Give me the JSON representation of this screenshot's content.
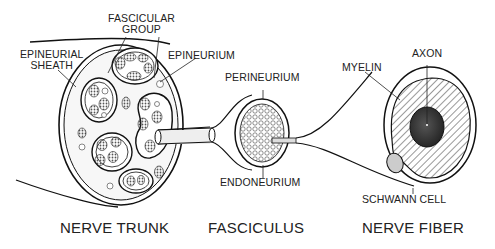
{
  "diagram": {
    "labels": {
      "fascicular_group_line1": "FASCICULAR",
      "fascicular_group_line2": "GROUP",
      "epineurial_sheath_line1": "EPINEURIAL",
      "epineurial_sheath_line2": "SHEATH",
      "epineurium": "EPINEURIUM",
      "perineurium": "PERINEURIUM",
      "endoneurium": "ENDONEURIUM",
      "myelin": "MYELIN",
      "axon": "AXON",
      "schwann_cell": "SCHWANN CELL"
    },
    "captions": {
      "nerve_trunk": "NERVE TRUNK",
      "fasciculus": "FASCICULUS",
      "nerve_fiber": "NERVE FIBER"
    },
    "colors": {
      "line": "#1a1a1a",
      "axon_fill": "#3a3a3a",
      "dot_fill": "#777777"
    }
  }
}
